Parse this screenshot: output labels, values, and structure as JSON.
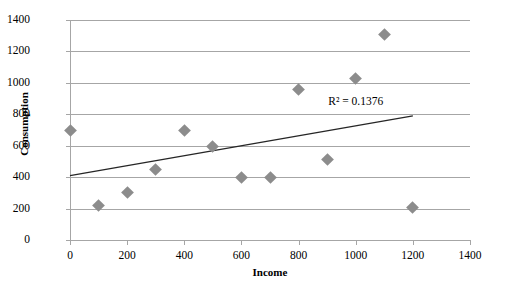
{
  "chart_data": {
    "type": "scatter",
    "title": "",
    "xlabel": "Income",
    "ylabel": "Consumption",
    "xlim": [
      0,
      1400
    ],
    "ylim": [
      0,
      1400
    ],
    "xticks": [
      0,
      200,
      400,
      600,
      800,
      1000,
      1200,
      1400
    ],
    "yticks": [
      0,
      200,
      400,
      600,
      800,
      1000,
      1200,
      1400
    ],
    "xtick_labels": [
      "0",
      "200",
      "400",
      "600",
      "800",
      "1000",
      "1200",
      "1400"
    ],
    "ytick_labels": [
      "0",
      "200",
      "400",
      "600",
      "800",
      "1000",
      "1200",
      "1400"
    ],
    "grid": "horizontal",
    "legend": "none",
    "marker_shape": "diamond",
    "marker_color": "#8c8c8c",
    "points": [
      {
        "x": 0,
        "y": 700
      },
      {
        "x": 100,
        "y": 220
      },
      {
        "x": 200,
        "y": 300
      },
      {
        "x": 300,
        "y": 450
      },
      {
        "x": 400,
        "y": 700
      },
      {
        "x": 500,
        "y": 595
      },
      {
        "x": 600,
        "y": 400
      },
      {
        "x": 700,
        "y": 400
      },
      {
        "x": 800,
        "y": 955
      },
      {
        "x": 900,
        "y": 510
      },
      {
        "x": 1000,
        "y": 1030
      },
      {
        "x": 1100,
        "y": 1310
      },
      {
        "x": 1200,
        "y": 205
      }
    ],
    "trendline": {
      "type": "linear",
      "color": "#262626",
      "x_start": 0,
      "y_start": 410,
      "x_end": 1200,
      "y_end": 790
    },
    "annotations": [
      {
        "name": "r-squared-label",
        "text": "R² = 0.1376",
        "x": 1000,
        "y": 880
      }
    ]
  }
}
